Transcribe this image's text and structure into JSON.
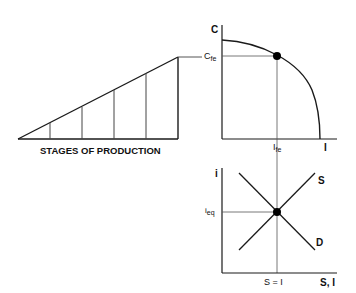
{
  "diagram": {
    "stages_panel": {
      "label": "STAGES OF PRODUCTION",
      "stage_count": 5
    },
    "ppf_panel": {
      "y_axis_label": "C",
      "x_axis_label": "I",
      "y_marker": {
        "main": "C",
        "sub": "fe"
      },
      "x_marker": {
        "main": "I",
        "sub": "fe"
      }
    },
    "loanable_funds_panel": {
      "y_axis_label": "i",
      "x_axis_label": "S, I",
      "y_marker": {
        "main": "i",
        "sub": "eq"
      },
      "x_marker": "S = I",
      "supply_label": "S",
      "demand_label": "D"
    },
    "colors": {
      "line": "#1a1a1a",
      "thin_line": "#555555",
      "background": "#ffffff"
    }
  }
}
